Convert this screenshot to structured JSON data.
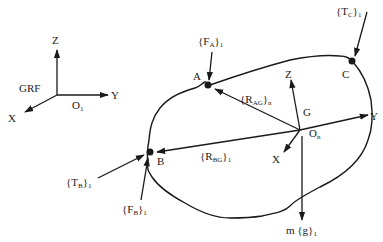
{
  "diagram": {
    "type": "free-body diagram",
    "ground_frame": {
      "label": "GRF",
      "origin_label": "O",
      "origin_sub": "1",
      "axes": {
        "x": "X",
        "y": "Y",
        "z": "Z"
      }
    },
    "body_frame": {
      "center_label": "G",
      "origin_label": "O",
      "origin_sub": "n",
      "axes": {
        "x": "X",
        "y": "Y",
        "z": "Z"
      }
    },
    "points": [
      {
        "id": "A",
        "label": "A"
      },
      {
        "id": "B",
        "label": "B"
      },
      {
        "id": "C",
        "label": "C"
      }
    ],
    "forces": {
      "F_A": {
        "open": "{F",
        "sub": "A",
        "close": "}",
        "frame": "1"
      },
      "T_C": {
        "open": "{T",
        "sub": "C",
        "close": "}",
        "frame": "1"
      },
      "T_B": {
        "open": "{T",
        "sub": "B",
        "close": "}",
        "frame": "1"
      },
      "F_B": {
        "open": "{F",
        "sub": "B",
        "close": "}",
        "frame": "1"
      },
      "weight": {
        "open": "m {g}",
        "frame": "1"
      }
    },
    "position_vectors": {
      "R_AG": {
        "open": "{R",
        "sub": "AG",
        "close": "}",
        "frame": "n"
      },
      "R_BG": {
        "open": "{R",
        "sub": "BG",
        "close": "}",
        "frame": "1"
      }
    }
  }
}
